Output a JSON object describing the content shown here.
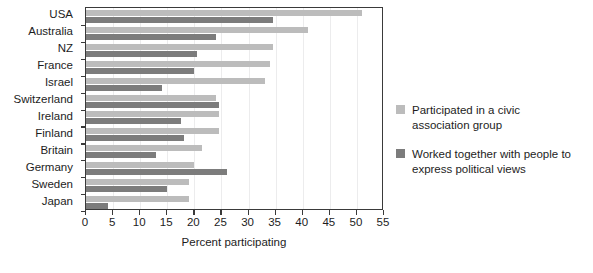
{
  "chart_data": {
    "type": "bar",
    "orientation": "horizontal",
    "title": "",
    "xlabel": "Percent participating",
    "ylabel": "",
    "xlim": [
      0,
      55
    ],
    "xticks": [
      0,
      5,
      10,
      15,
      20,
      25,
      30,
      35,
      40,
      45,
      50,
      55
    ],
    "grid": true,
    "legend_position": "right",
    "categories": [
      "USA",
      "Australia",
      "NZ",
      "France",
      "Israel",
      "Switzerland",
      "Ireland",
      "Finland",
      "Britain",
      "Germany",
      "Sweden",
      "Japan"
    ],
    "series": [
      {
        "name": "Participated in a civic association group",
        "color": "#bcbcbc",
        "values": [
          51,
          41,
          34.5,
          34,
          33,
          24,
          24.5,
          24.5,
          21.5,
          20,
          19,
          19
        ]
      },
      {
        "name": "Worked together with people to express political views",
        "color": "#7c7c7c",
        "values": [
          34.5,
          24,
          20.5,
          20,
          14,
          24.5,
          17.5,
          18,
          13,
          26,
          15,
          4
        ]
      }
    ]
  },
  "legend": {
    "entries": [
      {
        "label": "Participated in a civic association group",
        "swatch": "light"
      },
      {
        "label": "Worked together with people to express political views",
        "swatch": "dark"
      }
    ]
  },
  "colors": {
    "light_bar": "#bcbcbc",
    "dark_bar": "#7c7c7c",
    "axis": "#3a3a3a",
    "gridline": "#ececed",
    "text": "#1d1d1d",
    "background": "#ffffff"
  }
}
